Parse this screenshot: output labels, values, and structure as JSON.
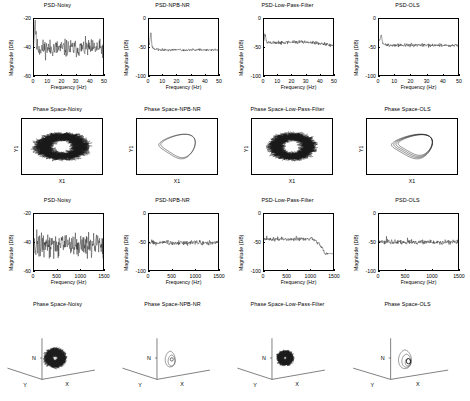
{
  "figure": {
    "rows": 4,
    "cols": 4,
    "conditions": [
      "Noisy",
      "NPB-NR",
      "Low-Pass-Filter",
      "OLS"
    ],
    "background": "#ffffff",
    "line_color": "#1a1a1a"
  },
  "labels": {
    "magnitude_axis": "Magnitude (DB)",
    "frequency_axis": "Frequency (Hz)",
    "phase_y": "Y1",
    "phase_x": "X1",
    "axis3d_n": "N",
    "axis3d_y": "Y",
    "axis3d_x": "X"
  },
  "chart_data": [
    {
      "id": "r1c1",
      "type": "line",
      "title": "PSD-Noisy",
      "xlabel": "Frequency (Hz)",
      "ylabel": "Magnitude (DB)",
      "xlim": [
        0,
        50
      ],
      "ylim": [
        -60,
        -20
      ],
      "xticks": [
        0,
        10,
        20,
        30,
        40,
        50
      ],
      "yticks": [
        -20,
        -40,
        -60
      ],
      "grid": false,
      "noise_floor_db": -41,
      "noise_spread_db": 6,
      "peak_db": -24,
      "peak_hz": 1.5,
      "description": "Broadband noisy PSD, flat floor near -41 dB with large scatter"
    },
    {
      "id": "r1c2",
      "type": "line",
      "title": "PSD-NPB-NR",
      "xlabel": "Frequency (Hz)",
      "ylabel": "Magnitude (DB)",
      "xlim": [
        0,
        50
      ],
      "ylim": [
        -100,
        0
      ],
      "xticks": [
        0,
        10,
        20,
        30,
        40,
        50
      ],
      "yticks": [
        0,
        -50,
        -100
      ],
      "grid": false,
      "noise_floor_db": -55,
      "noise_spread_db": 2,
      "peak_db": -30,
      "peak_hz": 2,
      "description": "Sharp low-frequency peak then smooth decay to flat -55 dB floor"
    },
    {
      "id": "r1c3",
      "type": "line",
      "title": "PSD-Low-Pass-Filter",
      "xlabel": "Frequency (Hz)",
      "ylabel": "Magnitude (DB)",
      "xlim": [
        0,
        50
      ],
      "ylim": [
        -100,
        0
      ],
      "xticks": [
        0,
        10,
        20,
        30,
        40,
        50
      ],
      "yticks": [
        0,
        -50,
        -100
      ],
      "grid": false,
      "noise_floor_db": -44,
      "noise_spread_db": 3,
      "peak_db": -32,
      "peak_hz": 1.5,
      "description": "Low-pass response, gentle droop from -44 dB to -55 dB across band"
    },
    {
      "id": "r1c4",
      "type": "line",
      "title": "PSD-OLS",
      "xlabel": "Frequency (Hz)",
      "ylabel": "Magnitude (DB)",
      "xlim": [
        0,
        50
      ],
      "ylim": [
        -100,
        0
      ],
      "xticks": [
        0,
        10,
        20,
        30,
        40,
        50
      ],
      "yticks": [
        0,
        -50,
        -100
      ],
      "grid": false,
      "noise_floor_db": -47,
      "noise_spread_db": 3,
      "peak_db": -33,
      "peak_hz": 2,
      "description": "Low-frequency peak then flat -47 dB floor"
    },
    {
      "id": "r2c1",
      "type": "scatter",
      "title": "Phase Space-Noisy",
      "xlabel": "X1",
      "ylabel": "Y1",
      "grid": false,
      "orbit": "filled-noise-cloud",
      "description": "Dense noisy attractor filling a wide horizontal band"
    },
    {
      "id": "r2c2",
      "type": "line",
      "title": "Phase Space-NPB-NR",
      "xlabel": "X1",
      "ylabel": "Y1",
      "grid": false,
      "orbit": "clean-limit-cycle",
      "description": "Clean closed limit cycle, two nested loops"
    },
    {
      "id": "r2c3",
      "type": "scatter",
      "title": "Phase Space-Low-Pass-Filter",
      "xlabel": "X1",
      "ylabel": "Y1",
      "grid": false,
      "orbit": "filled-noise-cloud",
      "description": "Dense noisy attractor, slightly narrower than Noisy"
    },
    {
      "id": "r2c4",
      "type": "line",
      "title": "Phase Space-OLS",
      "xlabel": "X1",
      "ylabel": "Y1",
      "grid": false,
      "orbit": "clean-limit-cycle",
      "description": "Clean closed limit cycle with a few overlapping loops"
    },
    {
      "id": "r3c1",
      "type": "line",
      "title": "PSD-Noisy",
      "xlabel": "Frequency (Hz)",
      "ylabel": "Magnitude (DB)",
      "xlim": [
        0,
        1500
      ],
      "ylim": [
        -60,
        -20
      ],
      "xticks": [
        0,
        500,
        1000,
        1500
      ],
      "yticks": [
        -20,
        -40,
        -60
      ],
      "grid": false,
      "noise_floor_db": -42,
      "noise_spread_db": 8,
      "description": "Wideband noisy PSD with harmonic spikes to -31 dB"
    },
    {
      "id": "r3c2",
      "type": "line",
      "title": "PSD-NPB-NR",
      "xlabel": "Frequency (Hz)",
      "ylabel": "Magnitude (DB)",
      "xlim": [
        0,
        1500
      ],
      "ylim": [
        -100,
        0
      ],
      "xticks": [
        0,
        500,
        1000,
        1500
      ],
      "yticks": [
        0,
        -50,
        -100
      ],
      "grid": false,
      "noise_floor_db": -51,
      "noise_spread_db": 4,
      "description": "Flat -51 dB floor with discrete harmonic spikes near -38 dB"
    },
    {
      "id": "r3c3",
      "type": "line",
      "title": "PSD-Low-Pass-Filter",
      "xlabel": "Frequency (Hz)",
      "ylabel": "Magnitude (DB)",
      "xlim": [
        0,
        1500
      ],
      "ylim": [
        -100,
        0
      ],
      "xticks": [
        0,
        500,
        1000,
        1500
      ],
      "yticks": [
        0,
        -50,
        -100
      ],
      "grid": false,
      "noise_floor_db": -45,
      "cutoff_hz": 1000,
      "stopband_db": -70,
      "description": "Flat passband to ~1000 Hz then sharp rolloff to -70 dB stopband"
    },
    {
      "id": "r3c4",
      "type": "line",
      "title": "PSD-OLS",
      "xlabel": "Frequency (Hz)",
      "ylabel": "Magnitude (DB)",
      "xlim": [
        0,
        1500
      ],
      "ylim": [
        -100,
        0
      ],
      "xticks": [
        0,
        500,
        1000,
        1500
      ],
      "yticks": [
        0,
        -50,
        -100
      ],
      "grid": false,
      "noise_floor_db": -50,
      "noise_spread_db": 4,
      "description": "Flat -50 dB floor with harmonic spikes at low frequency"
    },
    {
      "id": "r4c1",
      "type": "scatter",
      "title": "Phase Space-Noisy",
      "xlabel": "X",
      "ylabel": "Y",
      "zlabel": "N",
      "grid": false,
      "orbit": "3d-noise-cloud",
      "description": "3D noisy attractor cloud"
    },
    {
      "id": "r4c2",
      "type": "line",
      "title": "Phase Space-NPB-NR",
      "xlabel": "X",
      "ylabel": "Y",
      "zlabel": "N",
      "grid": false,
      "orbit": "3d-clean-orbit",
      "description": "3D clean closed orbit, small nested loops"
    },
    {
      "id": "r4c3",
      "type": "scatter",
      "title": "Phase Space-Low-Pass-Filter",
      "xlabel": "X",
      "ylabel": "Y",
      "zlabel": "N",
      "grid": false,
      "orbit": "3d-noise-cloud",
      "description": "3D noisy attractor cloud, tighter than Noisy"
    },
    {
      "id": "r4c4",
      "type": "line",
      "title": "Phase Space-OLS",
      "xlabel": "X",
      "ylabel": "Y",
      "zlabel": "N",
      "grid": false,
      "orbit": "3d-clean-orbit",
      "description": "3D clean closed orbit with inner spiral"
    }
  ]
}
